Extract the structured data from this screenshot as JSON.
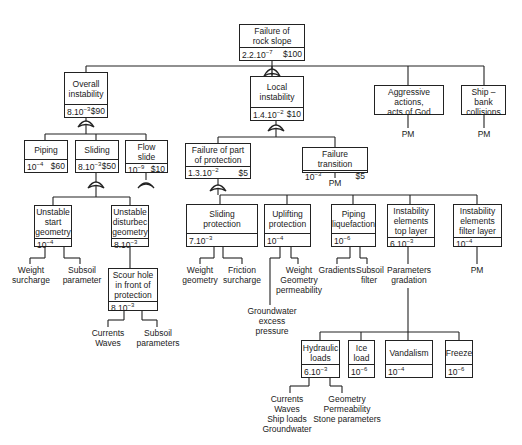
{
  "diagram": {
    "type": "fault-tree",
    "nodes": {
      "root": {
        "title": "Failure of\nrock slope",
        "prob_base": "2.2.10",
        "prob_exp": "−7",
        "cost": "$100"
      },
      "overall": {
        "title": "Overall\ninstability",
        "prob_base": "8.10",
        "prob_exp": "−3",
        "cost": "$90"
      },
      "local": {
        "title": "Local\ninstability",
        "prob_base": "1.4.10",
        "prob_exp": "−2",
        "cost": "$10"
      },
      "aggressive": {
        "title": "Aggressive actions,\nacts of God"
      },
      "ship": {
        "title": "Ship – bank\ncollisions"
      },
      "piping": {
        "title": "Piping",
        "prob_base": "10",
        "prob_exp": "−4",
        "cost": "$60"
      },
      "sliding": {
        "title": "Sliding",
        "prob_base": "8.10",
        "prob_exp": "−3",
        "cost": "$50"
      },
      "flowslide": {
        "title": "Flow slide",
        "prob_base": "10",
        "prob_exp": "−9",
        "cost": "$10"
      },
      "failpart": {
        "title": "Failure of part\nof protection",
        "prob_base": "1.3.10",
        "prob_exp": "−2",
        "cost": "$5"
      },
      "failtrans": {
        "title": "Failure transition",
        "prob_base": "10",
        "prob_exp": "−3",
        "cost": "$5"
      },
      "unstart": {
        "title": "Unstable\nstart\ngeometry",
        "prob_base": "10",
        "prob_exp": "−4"
      },
      "undist": {
        "title": "Unstable\ndisturbec\ngeometry",
        "prob_base": "8.10",
        "prob_exp": "−3"
      },
      "scour": {
        "title": "Scour hole\nin front of\nprotection",
        "prob_base": "8.10",
        "prob_exp": "−3"
      },
      "slidprot": {
        "title": "Sliding\nprotection",
        "prob_base": "7.10",
        "prob_exp": "−3"
      },
      "uplift": {
        "title": "Uplifting\nprotection",
        "prob_base": "10",
        "prob_exp": "−4"
      },
      "pipliq": {
        "title": "Piping\nliquefaction",
        "prob_base": "10",
        "prob_exp": "−6"
      },
      "insttop": {
        "title": "Instability\nelements\ntop layer",
        "prob_base": "6.10",
        "prob_exp": "−3"
      },
      "instfilt": {
        "title": "Instability\nelements\nfilter layer",
        "prob_base": "10",
        "prob_exp": "−4"
      },
      "hydraulic": {
        "title": "Hydraulic\nloads",
        "prob_base": "6.10",
        "prob_exp": "−3"
      },
      "ice": {
        "title": "Ice\nload",
        "prob_base": "10",
        "prob_exp": "−6"
      },
      "vandalism": {
        "title": "Vandalism",
        "prob_base": "10",
        "prob_exp": "−4"
      },
      "freeze": {
        "title": "Freeze",
        "prob_base": "10",
        "prob_exp": "−6"
      }
    },
    "leaves": {
      "pm_aggressive": "PM",
      "pm_ship": "PM",
      "pm_failtrans": "PM",
      "pm_instfilt": "PM",
      "weight_surcharge": "Weight\nsurcharge",
      "subsoil_parameter": "Subsoil\nparameter",
      "currents_waves": "Currents\nWaves",
      "subsoil_parameters": "Subsoil\nparameters",
      "weight_geometry": "Weight\ngeometry",
      "friction_surcharge": "Friction\nsurcharge",
      "weight_geom_perm": "Weight\nGeometry\npermeability",
      "groundwater_excess": "Groundwater\nexcess pressure",
      "gradients": "Gradients",
      "subsoil_filter": "Subsoil\nfilter",
      "parameters_gradation": "Parameters\ngradation",
      "hydraulic_causes": "Currents\nWaves\nShip loads\nGroundwater",
      "hydraulic_params": "Geometry\nPermeability\nStone parameters"
    }
  }
}
